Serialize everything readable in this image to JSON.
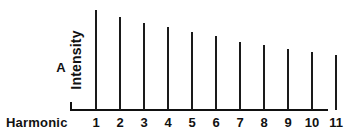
{
  "figure": {
    "panel_label": "A",
    "background_color": "#ffffff",
    "line_color": "#1a1a1a"
  },
  "chart_data": {
    "type": "bar",
    "title": "",
    "subtitle": "",
    "xlabel": "Harmonic",
    "ylabel": "Intensity",
    "categories": [
      "1",
      "2",
      "3",
      "4",
      "5",
      "6",
      "7",
      "8",
      "9",
      "10",
      "11"
    ],
    "values": [
      1.0,
      0.93,
      0.87,
      0.83,
      0.78,
      0.74,
      0.68,
      0.65,
      0.61,
      0.58,
      0.55
    ],
    "ylim": [
      0,
      1.05
    ],
    "xlim": [
      0.5,
      11.5
    ],
    "grid": false,
    "legend": null,
    "y_tick_labels": [],
    "annotations": [
      "A"
    ],
    "style": "line-spectrum stems, decreasing intensity with harmonic number"
  }
}
